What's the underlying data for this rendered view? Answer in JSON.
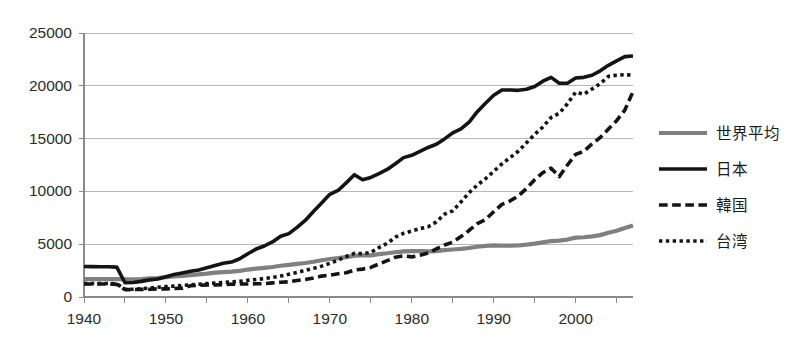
{
  "chart_data": {
    "type": "line",
    "title": "",
    "subtitle": "",
    "xlabel": "",
    "ylabel": "",
    "xlim": [
      1940,
      2007
    ],
    "ylim": [
      0,
      25000
    ],
    "grid": true,
    "legend_position": "right",
    "y_ticks": [
      0,
      5000,
      10000,
      15000,
      20000,
      25000
    ],
    "y_tick_labels": [
      "0",
      "5000",
      "10000",
      "15000",
      "20000",
      "25000"
    ],
    "x_ticks": [
      1940,
      1950,
      1960,
      1970,
      1980,
      1990,
      2000
    ],
    "x_tick_labels": [
      "1940",
      "1950",
      "1960",
      "1970",
      "1980",
      "1990",
      "2000"
    ],
    "x_minor_tick_step": 5,
    "x": [
      1940,
      1941,
      1942,
      1943,
      1944,
      1945,
      1946,
      1947,
      1948,
      1949,
      1950,
      1951,
      1952,
      1953,
      1954,
      1955,
      1956,
      1957,
      1958,
      1959,
      1960,
      1961,
      1962,
      1963,
      1964,
      1965,
      1966,
      1967,
      1968,
      1969,
      1970,
      1971,
      1972,
      1973,
      1974,
      1975,
      1976,
      1977,
      1978,
      1979,
      1980,
      1981,
      1982,
      1983,
      1984,
      1985,
      1986,
      1987,
      1988,
      1989,
      1990,
      1991,
      1992,
      1993,
      1994,
      1995,
      1996,
      1997,
      1998,
      1999,
      2000,
      2001,
      2002,
      2003,
      2004,
      2005,
      2006,
      2007
    ],
    "series": [
      {
        "name": "世界平均",
        "color": "#808080",
        "style": "solid",
        "width": 4.2,
        "values": [
          1700,
          1700,
          1700,
          1700,
          1700,
          1680,
          1680,
          1700,
          1760,
          1800,
          1880,
          1950,
          2000,
          2080,
          2140,
          2210,
          2300,
          2360,
          2400,
          2480,
          2600,
          2680,
          2760,
          2840,
          2960,
          3040,
          3140,
          3220,
          3340,
          3480,
          3600,
          3680,
          3780,
          3920,
          3940,
          3940,
          4060,
          4140,
          4240,
          4320,
          4340,
          4340,
          4320,
          4340,
          4440,
          4500,
          4560,
          4640,
          4760,
          4840,
          4880,
          4860,
          4860,
          4880,
          4960,
          5060,
          5180,
          5300,
          5340,
          5440,
          5620,
          5660,
          5740,
          5860,
          6080,
          6280,
          6540,
          6780
        ]
      },
      {
        "name": "日本",
        "color": "#141414",
        "style": "solid",
        "width": 3.6,
        "values": [
          2890,
          2880,
          2870,
          2860,
          2830,
          1350,
          1370,
          1480,
          1620,
          1700,
          1920,
          2120,
          2280,
          2430,
          2560,
          2770,
          2980,
          3200,
          3310,
          3620,
          4100,
          4540,
          4830,
          5210,
          5760,
          6000,
          6590,
          7250,
          8100,
          8900,
          9720,
          10090,
          10810,
          11580,
          11100,
          11320,
          11690,
          12080,
          12620,
          13200,
          13420,
          13790,
          14160,
          14460,
          14970,
          15540,
          15910,
          16570,
          17550,
          18350,
          19100,
          19600,
          19600,
          19570,
          19680,
          19930,
          20440,
          20800,
          20240,
          20240,
          20740,
          20800,
          21000,
          21420,
          21940,
          22360,
          22760,
          22820
        ]
      },
      {
        "name": "韓国",
        "color": "#141414",
        "style": "dashed",
        "width": 3.6,
        "values": [
          1230,
          1230,
          1230,
          1230,
          1200,
          700,
          700,
          720,
          740,
          770,
          770,
          800,
          840,
          1060,
          1100,
          1150,
          1140,
          1180,
          1210,
          1230,
          1230,
          1250,
          1260,
          1340,
          1400,
          1440,
          1570,
          1650,
          1800,
          1980,
          2070,
          2200,
          2300,
          2560,
          2640,
          2800,
          3130,
          3440,
          3770,
          3900,
          3800,
          3950,
          4160,
          4550,
          4920,
          5200,
          5720,
          6300,
          6940,
          7340,
          8080,
          8770,
          9100,
          9560,
          10280,
          11110,
          11780,
          12200,
          11400,
          12500,
          13500,
          13800,
          14500,
          15100,
          15900,
          16700,
          17700,
          19450
        ]
      },
      {
        "name": "台湾",
        "color": "#141414",
        "style": "dotted",
        "width": 3.6,
        "values": [
          1280,
          1280,
          1280,
          1280,
          1250,
          730,
          740,
          780,
          850,
          920,
          980,
          1030,
          1090,
          1160,
          1210,
          1270,
          1310,
          1370,
          1420,
          1490,
          1580,
          1660,
          1740,
          1850,
          1990,
          2150,
          2320,
          2520,
          2710,
          2920,
          3190,
          3480,
          3840,
          4130,
          4110,
          4220,
          4680,
          5080,
          5660,
          6030,
          6250,
          6480,
          6650,
          7110,
          7840,
          8160,
          9000,
          9880,
          10600,
          11200,
          11900,
          12600,
          13200,
          13800,
          14600,
          15400,
          16100,
          17000,
          17400,
          18300,
          19400,
          19200,
          19700,
          20200,
          20900,
          21000,
          21050,
          21000
        ]
      }
    ]
  },
  "legend": {
    "entries": [
      {
        "label": "世界平均"
      },
      {
        "label": "日本"
      },
      {
        "label": "韓国"
      },
      {
        "label": "台湾"
      }
    ]
  }
}
